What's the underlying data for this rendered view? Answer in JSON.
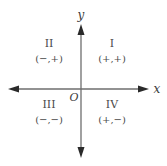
{
  "diagram": {
    "axes": {
      "x_label": "x",
      "y_label": "y",
      "origin_label": "O"
    },
    "quadrants": [
      {
        "numeral": "I",
        "signs": "(+,+)"
      },
      {
        "numeral": "II",
        "signs": "(−,+)"
      },
      {
        "numeral": "III",
        "signs": "(−,−)"
      },
      {
        "numeral": "IV",
        "signs": "(+,−)"
      }
    ],
    "colors": {
      "axis": "#6e6e6e",
      "arrowhead": "#2a2a2a",
      "text": "#4a4a4a"
    }
  }
}
